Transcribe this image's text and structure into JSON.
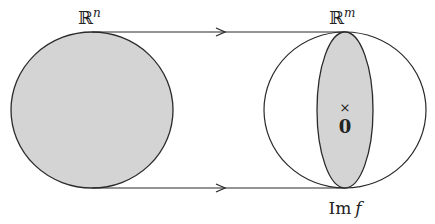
{
  "diagram": {
    "domain_label": "ℝ",
    "domain_exp": "n",
    "codomain_label": "ℝ",
    "codomain_exp": "m",
    "image_label": "Im",
    "image_func": "f",
    "origin_marker": "×",
    "origin_label": "0",
    "colors": {
      "stroke": "#2a2a2a",
      "fill": "#d4d4d4",
      "background": "#ffffff"
    }
  }
}
